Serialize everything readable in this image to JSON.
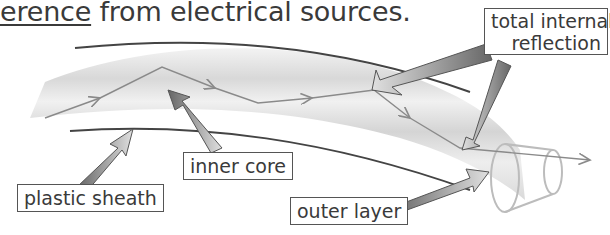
{
  "heading": {
    "underlined_fragment": "erence",
    "rest": " from electrical sources."
  },
  "labels": {
    "total_internal_reflection_line1": "total internal",
    "total_internal_reflection_line2": "reflection",
    "inner_core": "inner core",
    "plastic_sheath": "plastic sheath",
    "outer_layer": "outer layer"
  },
  "colors": {
    "text": "#3a3a3a",
    "cable_fill": "#dcdcdc",
    "arrow_dark": "#6e6e6e",
    "arrow_light": "#d4d4d4",
    "ray": "#8a8a8a",
    "outline": "#444444"
  }
}
